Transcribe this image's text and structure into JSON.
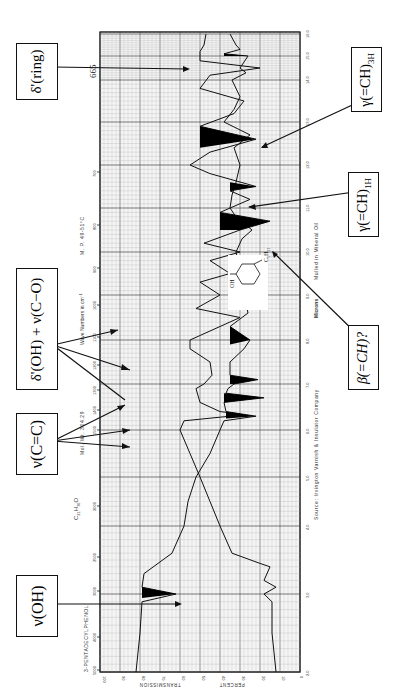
{
  "chart_data": {
    "type": "line",
    "orientation": "rotated 90deg counter-clockwise (landscape IR spectrum printed sideways)",
    "title": "3-PENTADECYLPHENOL",
    "formula": "C21H36O",
    "mol_wt": "Mol. Wt. 304.29",
    "melting_point": "M. P. 49-51°C",
    "sample_prep": "Mulled in Mineral Oil",
    "source": "Source: Irvington Varnish & Insulator Company",
    "x_axis_top_label": "Wave Numbers in cm⁻¹",
    "x_axis_bottom_label": "Microns",
    "y_axis_label": "PERCENT TRANSMISSION",
    "wavenumber_ticks": [
      "5000",
      "4000",
      "3000",
      "2500",
      "2000",
      "1500",
      "1400",
      "1300",
      "1200",
      "1100",
      "1000",
      "900",
      "800",
      "700"
    ],
    "micron_ticks": [
      "2.0",
      "3.0",
      "4.0",
      "5.0",
      "6.0",
      "7.0",
      "8.0",
      "9.0",
      "10.0",
      "11.0",
      "12.0",
      "13.0",
      "14.0",
      "15.0",
      "16.0"
    ],
    "transmission_ticks": [
      "100",
      "90",
      "80",
      "70",
      "60",
      "50",
      "40",
      "30",
      "20",
      "10",
      "0"
    ],
    "ylim": [
      0,
      100
    ],
    "xlim_microns": [
      2.0,
      16.0
    ],
    "grid": true,
    "series": [
      {
        "name": "Upper trace (thin film)",
        "points_micron_T": [
          [
            2.0,
            82
          ],
          [
            2.5,
            80
          ],
          [
            2.9,
            79
          ],
          [
            3.0,
            62
          ],
          [
            3.1,
            79
          ],
          [
            3.3,
            78
          ],
          [
            3.6,
            64
          ],
          [
            4.0,
            58
          ],
          [
            4.5,
            56
          ],
          [
            5.0,
            52
          ],
          [
            5.5,
            45
          ],
          [
            6.0,
            40
          ],
          [
            6.2,
            38
          ],
          [
            6.3,
            22
          ],
          [
            6.4,
            37
          ],
          [
            6.6,
            38
          ],
          [
            6.7,
            18
          ],
          [
            6.8,
            37
          ],
          [
            6.9,
            36
          ],
          [
            7.0,
            33
          ],
          [
            7.1,
            21
          ],
          [
            7.2,
            35
          ],
          [
            7.5,
            35
          ],
          [
            7.8,
            28
          ],
          [
            8.0,
            25
          ],
          [
            8.15,
            30
          ],
          [
            8.3,
            35
          ],
          [
            8.6,
            26
          ],
          [
            9.0,
            28
          ],
          [
            9.5,
            30
          ],
          [
            10.0,
            32
          ],
          [
            10.3,
            29
          ],
          [
            10.5,
            24
          ],
          [
            10.8,
            32
          ],
          [
            11.0,
            35
          ],
          [
            11.3,
            34
          ],
          [
            11.6,
            32
          ],
          [
            12.0,
            30
          ],
          [
            12.4,
            33
          ],
          [
            12.7,
            25
          ],
          [
            13.0,
            38
          ],
          [
            13.3,
            33
          ],
          [
            13.6,
            30
          ],
          [
            14.0,
            34
          ],
          [
            14.3,
            27
          ],
          [
            14.5,
            30
          ],
          [
            15.0,
            26
          ],
          [
            15.1,
            38
          ],
          [
            15.3,
            30
          ],
          [
            15.5,
            32
          ],
          [
            16.0,
            35
          ]
        ]
      },
      {
        "name": "Lower trace (mull, offset)",
        "points_micron_T": [
          [
            2.0,
            12
          ],
          [
            2.5,
            14
          ],
          [
            2.9,
            14
          ],
          [
            3.0,
            18
          ],
          [
            3.1,
            12
          ],
          [
            3.2,
            18
          ],
          [
            3.4,
            15
          ],
          [
            3.45,
            20
          ],
          [
            3.6,
            34
          ],
          [
            4.0,
            40
          ],
          [
            4.5,
            45
          ],
          [
            5.0,
            50
          ],
          [
            5.5,
            55
          ],
          [
            6.0,
            60
          ],
          [
            6.2,
            58
          ],
          [
            6.3,
            35
          ],
          [
            6.35,
            30
          ],
          [
            6.4,
            40
          ],
          [
            6.6,
            50
          ],
          [
            6.9,
            52
          ],
          [
            7.0,
            48
          ],
          [
            7.2,
            44
          ],
          [
            7.5,
            45
          ],
          [
            7.8,
            55
          ],
          [
            8.0,
            55
          ],
          [
            8.5,
            30
          ],
          [
            8.7,
            52
          ],
          [
            9.0,
            40
          ],
          [
            9.3,
            50
          ],
          [
            9.5,
            35
          ],
          [
            9.8,
            45
          ],
          [
            10.0,
            30
          ],
          [
            10.2,
            48
          ],
          [
            10.5,
            30
          ],
          [
            10.7,
            15
          ],
          [
            10.9,
            40
          ],
          [
            11.2,
            25
          ],
          [
            11.4,
            35
          ],
          [
            11.5,
            22
          ],
          [
            11.8,
            45
          ],
          [
            12.0,
            55
          ],
          [
            12.3,
            45
          ],
          [
            12.6,
            22
          ],
          [
            12.9,
            50
          ],
          [
            13.2,
            33
          ],
          [
            13.5,
            28
          ],
          [
            13.8,
            50
          ],
          [
            14.2,
            45
          ],
          [
            14.5,
            20
          ],
          [
            14.8,
            50
          ],
          [
            15.2,
            50
          ],
          [
            15.5,
            48
          ],
          [
            16.0,
            47
          ]
        ]
      }
    ],
    "annotations": [
      {
        "label": "ν(OH)",
        "points_to_micron": 3.0,
        "trace": "upper"
      },
      {
        "label": "ν(C=C)",
        "points_to_micron": [
          6.2,
          6.3,
          6.7
        ],
        "trace": "upper"
      },
      {
        "label": "δ'(OH) + ν(C−O)",
        "points_to_micron": [
          7.1,
          8.15
        ],
        "trace": "upper"
      },
      {
        "label": "δ'(ring)",
        "points_to_micron": 15.1,
        "extra_label": "665",
        "trace": "upper"
      },
      {
        "label": "β(=CH)?",
        "points_to_micron": 10.8,
        "trace": "lower"
      },
      {
        "label": "γ(=CH)1H",
        "points_to_micron": 11.5,
        "trace": "lower"
      },
      {
        "label": "γ(=CH)3H",
        "points_to_micron": 12.8,
        "trace": "lower"
      }
    ]
  },
  "labels": {
    "title": "3-PENTADECYLPHENOL",
    "formula_c": "C",
    "formula_c_sub": "21",
    "formula_h": "H",
    "formula_h_sub": "36",
    "formula_o": "O",
    "mol_wt": "Mol. Wt. 304.29",
    "wave_numbers": "Wave Numbers in cm",
    "wave_numbers_sup": "−1",
    "mp": "M. P. 49-51°C",
    "microns": "Microns",
    "mulled": "Mulled in Mineral Oil",
    "source": "Source: Irvington Varnish & Insulator Company",
    "transmission": "TRANSMISSION",
    "percent": "PERCENT",
    "peak_665": "665",
    "structure_oh": "OH",
    "structure_r": "C",
    "structure_r_sub1": "5",
    "structure_r_h": "H",
    "structure_r_sub2": "11"
  },
  "boxes": {
    "nu_oh": {
      "main": "ν(OH)"
    },
    "nu_cc": {
      "main": "ν(C=C)"
    },
    "delta_oh": {
      "main": "δ'(OH) + ν(C−O)"
    },
    "delta_ring": {
      "main": "δ'(ring)"
    },
    "beta_ch": {
      "main": "β(=CH)?"
    },
    "gamma_1h": {
      "main": "γ(=CH)",
      "sub": "1H"
    },
    "gamma_3h": {
      "main": "γ(=CH)",
      "sub": "3H"
    }
  },
  "axes": {
    "wavenumbers": [
      {
        "label": "5000",
        "y": 670
      },
      {
        "label": "4000",
        "y": 637
      },
      {
        "label": "3000",
        "y": 591
      },
      {
        "label": "2500",
        "y": 557
      },
      {
        "label": "2000",
        "y": 506
      },
      {
        "label": "1500",
        "y": 430
      },
      {
        "label": "1400",
        "y": 410
      },
      {
        "label": "1300",
        "y": 390
      },
      {
        "label": "1200",
        "y": 365
      },
      {
        "label": "1100",
        "y": 337
      },
      {
        "label": "1000",
        "y": 305
      },
      {
        "label": "900",
        "y": 268
      },
      {
        "label": "800",
        "y": 225
      },
      {
        "label": "700",
        "y": 172
      }
    ],
    "microns": [
      {
        "label": "2.0",
        "y": 672
      },
      {
        "label": "3.0",
        "y": 594
      },
      {
        "label": "4.0",
        "y": 526
      },
      {
        "label": "5.0",
        "y": 477
      },
      {
        "label": "6.0",
        "y": 430
      },
      {
        "label": "7.0",
        "y": 384
      },
      {
        "label": "8.0",
        "y": 340
      },
      {
        "label": "9.0",
        "y": 295
      },
      {
        "label": "10.0",
        "y": 252
      },
      {
        "label": "11.0",
        "y": 208
      },
      {
        "label": "12.0",
        "y": 165
      },
      {
        "label": "13.0",
        "y": 122
      },
      {
        "label": "14.0",
        "y": 80
      },
      {
        "label": "15.0",
        "y": 56
      },
      {
        "label": "16.0",
        "y": 34
      }
    ],
    "transmission": [
      {
        "label": "100",
        "x": 101
      },
      {
        "label": "90",
        "x": 120
      },
      {
        "label": "80",
        "x": 140
      },
      {
        "label": "70",
        "x": 160
      },
      {
        "label": "60",
        "x": 180
      },
      {
        "label": "50",
        "x": 200
      },
      {
        "label": "40",
        "x": 220
      },
      {
        "label": "30",
        "x": 240
      },
      {
        "label": "20",
        "x": 260
      },
      {
        "label": "10",
        "x": 280
      },
      {
        "label": "0",
        "x": 298
      }
    ]
  }
}
